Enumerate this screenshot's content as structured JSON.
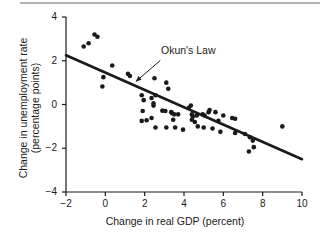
{
  "figure": {
    "rule_name": "top-divider"
  },
  "chart_data": {
    "type": "scatter",
    "title": "",
    "xlabel": "Change in real GDP (percent)",
    "ylabel": "Change in unemployment rate (percentage points)",
    "ylabel_line1": "Change in unemployment rate",
    "ylabel_line2": "(percentage points)",
    "xlim": [
      -2,
      10
    ],
    "ylim": [
      -4,
      4
    ],
    "xticks": [
      -2,
      0,
      2,
      4,
      6,
      8,
      10
    ],
    "xtick_labels": [
      "−2",
      "0",
      "2",
      "4",
      "6",
      "8",
      "10"
    ],
    "yticks": [
      -4,
      -2,
      0,
      2,
      4
    ],
    "ytick_labels": [
      "−4",
      "−2",
      "0",
      "2",
      "4"
    ],
    "grid": false,
    "legend": false,
    "annotations": [
      {
        "text": "Okun's Law",
        "x": 3.05,
        "y": 2.15,
        "arrow_to_x": 1.55,
        "arrow_to_y": 1.05
      }
    ],
    "trendline": {
      "name": "Okun's Law",
      "x": [
        -2,
        10
      ],
      "y": [
        2.25,
        -2.5
      ],
      "slope": -0.396,
      "intercept": 1.458,
      "color": "#1a1a1a",
      "width": 2.6
    },
    "points": [
      {
        "x": -1.1,
        "y": 2.65
      },
      {
        "x": -0.85,
        "y": 2.8
      },
      {
        "x": -0.55,
        "y": 3.2
      },
      {
        "x": -0.4,
        "y": 3.1
      },
      {
        "x": -0.1,
        "y": 1.25
      },
      {
        "x": -0.15,
        "y": 0.82
      },
      {
        "x": 0.35,
        "y": 1.78
      },
      {
        "x": 1.15,
        "y": 1.4
      },
      {
        "x": 1.25,
        "y": 1.3
      },
      {
        "x": 1.85,
        "y": 0.42
      },
      {
        "x": 1.95,
        "y": 0.2
      },
      {
        "x": 1.9,
        "y": -0.3
      },
      {
        "x": 1.85,
        "y": -0.75
      },
      {
        "x": 2.1,
        "y": -0.72
      },
      {
        "x": 2.35,
        "y": 0.3
      },
      {
        "x": 2.45,
        "y": 0.05
      },
      {
        "x": 2.45,
        "y": -0.05
      },
      {
        "x": 2.5,
        "y": 1.2
      },
      {
        "x": 2.55,
        "y": 0.42
      },
      {
        "x": 2.35,
        "y": -0.62
      },
      {
        "x": 2.55,
        "y": -1.05
      },
      {
        "x": 2.9,
        "y": -0.28
      },
      {
        "x": 3.05,
        "y": -0.3
      },
      {
        "x": 3.1,
        "y": 1.0
      },
      {
        "x": 3.2,
        "y": 0.72
      },
      {
        "x": 3.1,
        "y": -1.05
      },
      {
        "x": 3.35,
        "y": -0.35
      },
      {
        "x": 3.4,
        "y": -0.4
      },
      {
        "x": 3.5,
        "y": -0.45
      },
      {
        "x": 3.45,
        "y": -0.7
      },
      {
        "x": 3.55,
        "y": -1.05
      },
      {
        "x": 3.7,
        "y": -0.45
      },
      {
        "x": 3.95,
        "y": -1.15
      },
      {
        "x": 4.25,
        "y": -0.15
      },
      {
        "x": 4.35,
        "y": -0.05
      },
      {
        "x": 4.4,
        "y": -0.45
      },
      {
        "x": 4.45,
        "y": -0.55
      },
      {
        "x": 4.4,
        "y": -0.7
      },
      {
        "x": 4.55,
        "y": -0.8
      },
      {
        "x": 4.65,
        "y": -0.5
      },
      {
        "x": 4.7,
        "y": -1.0
      },
      {
        "x": 4.95,
        "y": -0.45
      },
      {
        "x": 5.05,
        "y": -0.5
      },
      {
        "x": 5.0,
        "y": -1.05
      },
      {
        "x": 5.25,
        "y": -0.35
      },
      {
        "x": 5.3,
        "y": -0.25
      },
      {
        "x": 5.45,
        "y": -1.1
      },
      {
        "x": 5.6,
        "y": -0.35
      },
      {
        "x": 5.75,
        "y": -0.75
      },
      {
        "x": 5.85,
        "y": -1.25
      },
      {
        "x": 6.0,
        "y": -0.5
      },
      {
        "x": 6.45,
        "y": -0.62
      },
      {
        "x": 6.6,
        "y": -0.65
      },
      {
        "x": 6.6,
        "y": -1.3
      },
      {
        "x": 7.1,
        "y": -1.35
      },
      {
        "x": 7.35,
        "y": -1.5
      },
      {
        "x": 7.3,
        "y": -2.15
      },
      {
        "x": 7.5,
        "y": -1.65
      },
      {
        "x": 7.55,
        "y": -1.95
      },
      {
        "x": 9.0,
        "y": -1.0
      }
    ],
    "point_color": "#1a1a1a",
    "point_radius": 2.3
  }
}
